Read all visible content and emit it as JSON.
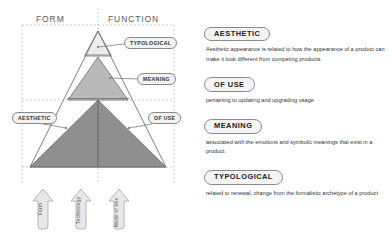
{
  "diagram": {
    "axis_labels": {
      "form": "FORM",
      "function": "FUNCTION"
    },
    "callouts": [
      {
        "id": "typological",
        "label": "TYPOLOGICAL"
      },
      {
        "id": "meaning",
        "label": "MEANING"
      },
      {
        "id": "aesthetic",
        "label": "AESTHETIC"
      },
      {
        "id": "of_use",
        "label": "OF USE"
      }
    ],
    "arrows": [
      {
        "label": "Form"
      },
      {
        "label": "Technology"
      },
      {
        "label": "Mode of Use"
      }
    ],
    "tiers": [
      {
        "name": "top",
        "fill": "#ededed"
      },
      {
        "name": "middle",
        "fill": "#b9b9b9"
      },
      {
        "name": "bottom",
        "fill": "#8f8f8f"
      }
    ],
    "colors": {
      "outline": "#6f6f6f",
      "guide": "#b0b0b0",
      "arrow_fill": "#e8e8e8",
      "arrow_stroke": "#a8a8a8"
    }
  },
  "panel": {
    "entries": [
      {
        "heading": "AESTHETIC",
        "body": "Aesthetic appearance is related to how the appearance of a product can make it look different from competing products"
      },
      {
        "heading": "OF USE",
        "body": "pertaining to updating and upgrading usage"
      },
      {
        "heading": "MEANING",
        "body": "associated with the emotions and symbolic meanings that exist in a product"
      },
      {
        "heading": "TYPOLOGICAL",
        "body": "related to renewal, change from the formalistic archetype of a product"
      }
    ]
  }
}
